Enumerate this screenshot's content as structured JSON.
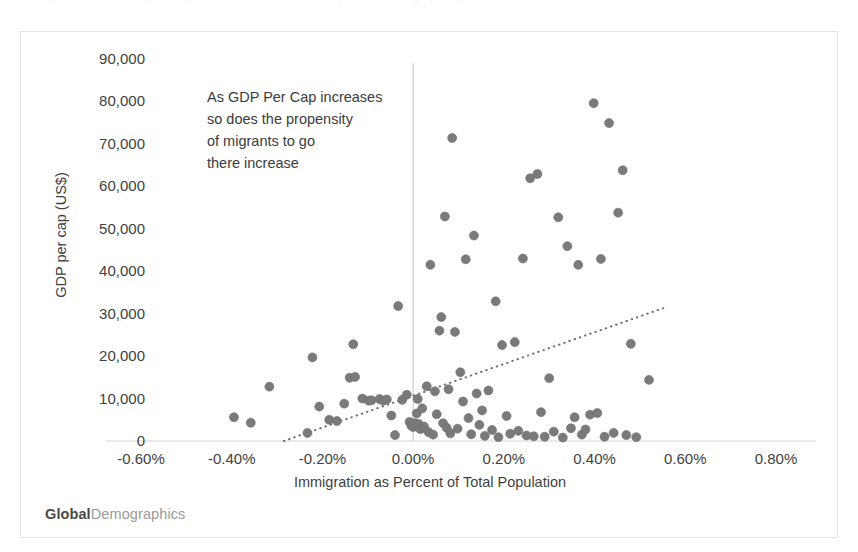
{
  "top_clip": {
    "text": "Immigration and GDP per Capita — scatter of countries (GlobalDemographics)"
  },
  "brand": {
    "strong": "Global",
    "light": "Demographics"
  },
  "annotation": {
    "lines": [
      "As GDP Per Cap increases",
      "so does the propensity",
      "of migrants to go",
      "there increase"
    ]
  },
  "colors": {
    "marker": "#7a7a7a",
    "marker_edge": "#6d6d6d",
    "axis_line": "#d4d4d4",
    "zero_line": "#c9c9c9",
    "trend_line": "#6f6f6f",
    "frame_border": "#e3e3e6",
    "text": "#3f3f3f",
    "brand_strong": "#4a4a4a",
    "brand_light": "#9a9a9a",
    "background": "#ffffff"
  },
  "chart_data": {
    "type": "scatter",
    "title": "",
    "subtitle": "",
    "xlabel": "Immigration as Percent of Total Population",
    "ylabel": "GDP per cap (US$)",
    "xlim": [
      -0.7,
      0.9
    ],
    "ylim": [
      0,
      90000
    ],
    "xticks": [
      -0.6,
      -0.4,
      -0.2,
      0.0,
      0.2,
      0.4,
      0.6,
      0.8
    ],
    "xtick_labels": [
      "-0.60%",
      "-0.40%",
      "-0.20%",
      "0.00%",
      "0.20%",
      "0.40%",
      "0.60%",
      "0.80%"
    ],
    "yticks": [
      0,
      10000,
      20000,
      30000,
      40000,
      50000,
      60000,
      70000,
      80000,
      90000
    ],
    "ytick_labels": [
      "0",
      "10,000",
      "20,000",
      "30,000",
      "40,000",
      "50,000",
      "60,000",
      "70,000",
      "80,000",
      "90,000"
    ],
    "grid": false,
    "legend": null,
    "legend_position": "none",
    "zero_line_x": 0.0,
    "marker_size_px": 9,
    "annotations": [
      {
        "text": "As GDP Per Cap increases so does the propensity of migrants to go there increase",
        "x": -0.1,
        "y": 82000
      }
    ],
    "trendline": {
      "type": "linear",
      "style": "dotted",
      "x_start": -0.285,
      "y_start": 0,
      "x_end": 0.557,
      "y_end": 31500
    },
    "series": [
      {
        "name": "Countries",
        "points": [
          [
            -0.395,
            5600
          ],
          [
            -0.358,
            4300
          ],
          [
            -0.317,
            12800
          ],
          [
            -0.233,
            1900
          ],
          [
            -0.222,
            19700
          ],
          [
            -0.207,
            8100
          ],
          [
            -0.185,
            5000
          ],
          [
            -0.168,
            4700
          ],
          [
            -0.152,
            8800
          ],
          [
            -0.14,
            14900
          ],
          [
            -0.132,
            22800
          ],
          [
            -0.128,
            15100
          ],
          [
            -0.112,
            10000
          ],
          [
            -0.098,
            9500
          ],
          [
            -0.092,
            9600
          ],
          [
            -0.074,
            9900
          ],
          [
            -0.066,
            9500
          ],
          [
            -0.058,
            9800
          ],
          [
            -0.048,
            6000
          ],
          [
            -0.04,
            1400
          ],
          [
            -0.033,
            31800
          ],
          [
            -0.024,
            9700
          ],
          [
            -0.014,
            10900
          ],
          [
            -0.008,
            4500
          ],
          [
            -0.004,
            3600
          ],
          [
            0.0,
            3300
          ],
          [
            0.004,
            4200
          ],
          [
            0.008,
            6500
          ],
          [
            0.01,
            9900
          ],
          [
            0.012,
            4000
          ],
          [
            0.016,
            2800
          ],
          [
            0.02,
            7700
          ],
          [
            0.024,
            3400
          ],
          [
            0.03,
            12900
          ],
          [
            0.034,
            2100
          ],
          [
            0.038,
            41500
          ],
          [
            0.044,
            1500
          ],
          [
            0.048,
            11700
          ],
          [
            0.052,
            6300
          ],
          [
            0.058,
            26000
          ],
          [
            0.062,
            29200
          ],
          [
            0.066,
            4200
          ],
          [
            0.07,
            52900
          ],
          [
            0.074,
            3100
          ],
          [
            0.078,
            12200
          ],
          [
            0.082,
            1800
          ],
          [
            0.086,
            71400
          ],
          [
            0.092,
            25700
          ],
          [
            0.098,
            2900
          ],
          [
            0.104,
            16200
          ],
          [
            0.11,
            9300
          ],
          [
            0.116,
            42800
          ],
          [
            0.122,
            5400
          ],
          [
            0.128,
            1600
          ],
          [
            0.134,
            48400
          ],
          [
            0.14,
            11200
          ],
          [
            0.146,
            3800
          ],
          [
            0.152,
            7200
          ],
          [
            0.158,
            1200
          ],
          [
            0.166,
            11900
          ],
          [
            0.174,
            2600
          ],
          [
            0.182,
            32900
          ],
          [
            0.188,
            900
          ],
          [
            0.196,
            22600
          ],
          [
            0.206,
            5900
          ],
          [
            0.214,
            1700
          ],
          [
            0.224,
            23300
          ],
          [
            0.232,
            2400
          ],
          [
            0.242,
            43000
          ],
          [
            0.25,
            1300
          ],
          [
            0.258,
            61900
          ],
          [
            0.266,
            1100
          ],
          [
            0.274,
            62900
          ],
          [
            0.282,
            6800
          ],
          [
            0.29,
            1000
          ],
          [
            0.3,
            14800
          ],
          [
            0.31,
            2200
          ],
          [
            0.32,
            52700
          ],
          [
            0.33,
            800
          ],
          [
            0.34,
            45900
          ],
          [
            0.348,
            3000
          ],
          [
            0.356,
            5600
          ],
          [
            0.364,
            41500
          ],
          [
            0.372,
            1500
          ],
          [
            0.38,
            2700
          ],
          [
            0.39,
            6200
          ],
          [
            0.398,
            79600
          ],
          [
            0.406,
            6600
          ],
          [
            0.414,
            42900
          ],
          [
            0.422,
            1000
          ],
          [
            0.432,
            74900
          ],
          [
            0.442,
            1900
          ],
          [
            0.452,
            53800
          ],
          [
            0.462,
            63800
          ],
          [
            0.47,
            1400
          ],
          [
            0.48,
            22900
          ],
          [
            0.492,
            900
          ],
          [
            0.52,
            14400
          ]
        ]
      }
    ]
  }
}
